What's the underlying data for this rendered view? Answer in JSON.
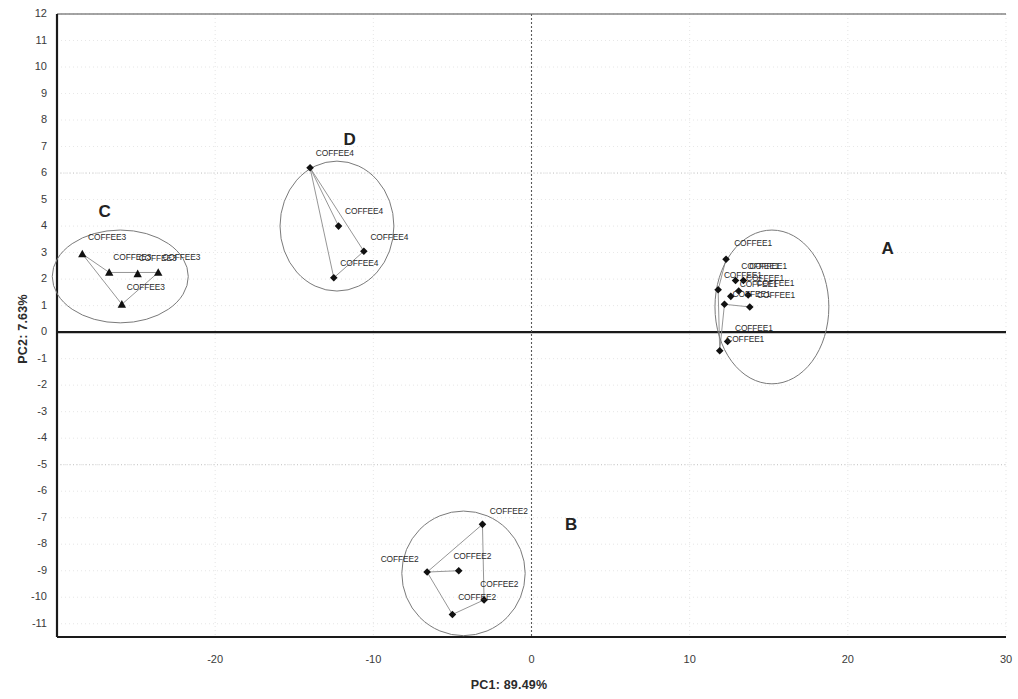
{
  "chart_data": {
    "type": "scatter",
    "title": "",
    "xlabel": "PC1: 89.49%",
    "ylabel": "PC2: 7.63%",
    "xlim": [
      -30,
      30
    ],
    "ylim": [
      -11.5,
      12
    ],
    "grid": true,
    "legend_position": "none",
    "xticks": [
      "-20",
      "-10",
      "0",
      "10",
      "20",
      "30"
    ],
    "xtick_values": [
      -20,
      -10,
      0,
      10,
      20,
      30
    ],
    "yticks": [
      "12",
      "11",
      "10",
      "9",
      "8",
      "7",
      "6",
      "5",
      "4",
      "3",
      "2",
      "1",
      "0",
      "-1",
      "-2",
      "-3",
      "-4",
      "-5",
      "-6",
      "-7",
      "-8",
      "-9",
      "-10",
      "-11"
    ],
    "ytick_values": [
      12,
      11,
      10,
      9,
      8,
      7,
      6,
      5,
      4,
      3,
      2,
      1,
      0,
      -1,
      -2,
      -3,
      -4,
      -5,
      -6,
      -7,
      -8,
      -9,
      -10,
      -11
    ],
    "annotations": [
      {
        "text": "A",
        "x": 22.5,
        "y": 3.1
      },
      {
        "text": "B",
        "x": 2.5,
        "y": -7.3
      },
      {
        "text": "C",
        "x": -27.0,
        "y": 4.5
      },
      {
        "text": "D",
        "x": -11.5,
        "y": 7.2
      }
    ],
    "groups": [
      {
        "name": "A",
        "label": "COFFEE1",
        "marker": "diamond",
        "ellipse": {
          "cx": 15.2,
          "cy": 0.95,
          "rx": 3.6,
          "ry": 2.9
        },
        "points": [
          {
            "x": 12.3,
            "y": 2.75,
            "label": "COFFEE1",
            "lx": 0.45,
            "ly": 0.45
          },
          {
            "x": 12.9,
            "y": 1.95,
            "label": "COFFEE1",
            "lx": 0.3,
            "ly": 0.4
          },
          {
            "x": 13.4,
            "y": 1.95,
            "label": "COFFEE1",
            "lx": 0.3,
            "ly": 0.4
          },
          {
            "x": 13.1,
            "y": 1.55,
            "label": "COFFEE1",
            "lx": 0.4,
            "ly": 0.35
          },
          {
            "x": 11.8,
            "y": 1.6,
            "label": "COFFEE1",
            "lx": 0.3,
            "ly": 0.4
          },
          {
            "x": 12.6,
            "y": 1.35,
            "label": "COFFEE1",
            "lx": 0.5,
            "ly": 0.3
          },
          {
            "x": 13.7,
            "y": 1.4,
            "label": "COFFEE1",
            "lx": 0.45,
            "ly": 0.3
          },
          {
            "x": 12.2,
            "y": 1.05,
            "label": "COFFEE1",
            "lx": 0.45,
            "ly": 0.25
          },
          {
            "x": 13.8,
            "y": 0.95,
            "label": "COFFEE1",
            "lx": 0.4,
            "ly": 0.3
          },
          {
            "x": 12.4,
            "y": -0.35,
            "label": "COFFEE1",
            "lx": 0.4,
            "ly": 0.35
          },
          {
            "x": 11.9,
            "y": -0.7,
            "label": "COFFEE1",
            "lx": 0.35,
            "ly": 0.3
          }
        ]
      },
      {
        "name": "B",
        "label": "COFFEE2",
        "marker": "diamond",
        "ellipse": {
          "cx": -4.3,
          "cy": -9.1,
          "rx": 3.9,
          "ry": 2.35
        },
        "points": [
          {
            "x": -3.1,
            "y": -7.25,
            "label": "COFFEE2",
            "lx": 0.4,
            "ly": 0.35
          },
          {
            "x": -6.6,
            "y": -9.05,
            "label": "COFFEE2",
            "lx": -3.0,
            "ly": 0.35
          },
          {
            "x": -4.6,
            "y": -9.0,
            "label": "COFFEE2",
            "lx": -0.4,
            "ly": 0.4
          },
          {
            "x": -3.0,
            "y": -10.1,
            "label": "COFFEE2",
            "lx": -0.3,
            "ly": 0.45
          },
          {
            "x": -5.0,
            "y": -10.65,
            "label": "COFFEE2",
            "lx": 0.3,
            "ly": 0.5
          }
        ]
      },
      {
        "name": "C",
        "label": "COFFEE3",
        "marker": "triangle",
        "ellipse": {
          "cx": -26.0,
          "cy": 2.1,
          "rx": 4.3,
          "ry": 1.75
        },
        "points": [
          {
            "x": -28.4,
            "y": 2.95,
            "label": "COFFEE3",
            "lx": 0.3,
            "ly": 0.5
          },
          {
            "x": -26.7,
            "y": 2.25,
            "label": "COFFEE3",
            "lx": 0.2,
            "ly": 0.45
          },
          {
            "x": -24.9,
            "y": 2.2,
            "label": "COFFEE3",
            "lx": 0.0,
            "ly": 0.45
          },
          {
            "x": -23.6,
            "y": 2.25,
            "label": "COFFEE3",
            "lx": 0.2,
            "ly": 0.45
          },
          {
            "x": -25.9,
            "y": 1.05,
            "label": "COFFEE3",
            "lx": 0.25,
            "ly": 0.5
          }
        ]
      },
      {
        "name": "D",
        "label": "COFFEE4",
        "marker": "diamond",
        "ellipse": {
          "cx": -12.3,
          "cy": 4.0,
          "rx": 3.6,
          "ry": 2.45
        },
        "points": [
          {
            "x": -14.0,
            "y": 6.2,
            "label": "COFFEE4",
            "lx": 0.3,
            "ly": 0.4
          },
          {
            "x": -12.2,
            "y": 4.0,
            "label": "COFFEE4",
            "lx": 0.35,
            "ly": 0.4
          },
          {
            "x": -10.6,
            "y": 3.05,
            "label": "COFFEE4",
            "lx": 0.35,
            "ly": 0.4
          },
          {
            "x": -12.5,
            "y": 2.05,
            "label": "COFFEE4",
            "lx": 0.35,
            "ly": 0.4
          }
        ]
      }
    ],
    "connectors": [
      {
        "group": "A",
        "from": [
          12.3,
          2.75
        ],
        "to": [
          11.8,
          1.6
        ]
      },
      {
        "group": "A",
        "from": [
          11.8,
          1.6
        ],
        "to": [
          11.9,
          -0.7
        ]
      },
      {
        "group": "A",
        "from": [
          11.9,
          -0.7
        ],
        "to": [
          12.2,
          1.05
        ]
      },
      {
        "group": "A",
        "from": [
          12.2,
          1.05
        ],
        "to": [
          13.8,
          0.95
        ]
      },
      {
        "group": "B",
        "from": [
          -3.1,
          -7.25
        ],
        "to": [
          -6.6,
          -9.05
        ]
      },
      {
        "group": "B",
        "from": [
          -3.1,
          -7.25
        ],
        "to": [
          -3.0,
          -10.1
        ]
      },
      {
        "group": "B",
        "from": [
          -6.6,
          -9.05
        ],
        "to": [
          -4.6,
          -9.0
        ]
      },
      {
        "group": "B",
        "from": [
          -6.6,
          -9.05
        ],
        "to": [
          -5.0,
          -10.65
        ]
      },
      {
        "group": "B",
        "from": [
          -5.0,
          -10.65
        ],
        "to": [
          -3.0,
          -10.1
        ]
      },
      {
        "group": "C",
        "from": [
          -28.4,
          2.95
        ],
        "to": [
          -26.7,
          2.25
        ]
      },
      {
        "group": "C",
        "from": [
          -26.7,
          2.25
        ],
        "to": [
          -23.6,
          2.25
        ]
      },
      {
        "group": "C",
        "from": [
          -28.4,
          2.95
        ],
        "to": [
          -25.9,
          1.05
        ]
      },
      {
        "group": "C",
        "from": [
          -25.9,
          1.05
        ],
        "to": [
          -23.6,
          2.25
        ]
      },
      {
        "group": "D",
        "from": [
          -14.0,
          6.2
        ],
        "to": [
          -12.2,
          4.0
        ]
      },
      {
        "group": "D",
        "from": [
          -14.0,
          6.2
        ],
        "to": [
          -10.6,
          3.05
        ]
      },
      {
        "group": "D",
        "from": [
          -14.0,
          6.2
        ],
        "to": [
          -12.5,
          2.05
        ]
      },
      {
        "group": "D",
        "from": [
          -12.5,
          2.05
        ],
        "to": [
          -10.6,
          3.05
        ]
      }
    ],
    "colors": {
      "axis": "#1a1a1a",
      "grid": "#dcdcdc",
      "marker": "#111111",
      "ellipse": "#7a7a7a",
      "connector": "#8a8a8a",
      "text": "#2a2a2a"
    }
  }
}
